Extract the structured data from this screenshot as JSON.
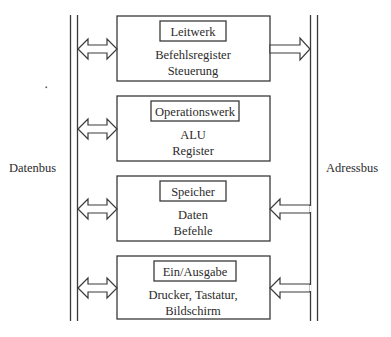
{
  "diagram": {
    "buses": {
      "data_bus": "Datenbus",
      "address_bus": "Adressbus"
    },
    "units": [
      {
        "title": "Leitwerk",
        "lines": [
          "Befehlsregister",
          "Steuerung"
        ],
        "data_bus_link": "bidirectional",
        "address_bus_link": "to-address-bus"
      },
      {
        "title": "Operationswerk",
        "lines": [
          "ALU",
          "Register"
        ],
        "data_bus_link": "bidirectional",
        "address_bus_link": "none"
      },
      {
        "title": "Speicher",
        "lines": [
          "Daten",
          "Befehle"
        ],
        "data_bus_link": "bidirectional",
        "address_bus_link": "from-address-bus"
      },
      {
        "title": "Ein/Ausgabe",
        "lines": [
          "Drucker, Tastatur,",
          "Bildschirm"
        ],
        "data_bus_link": "bidirectional",
        "address_bus_link": "from-address-bus"
      }
    ]
  }
}
